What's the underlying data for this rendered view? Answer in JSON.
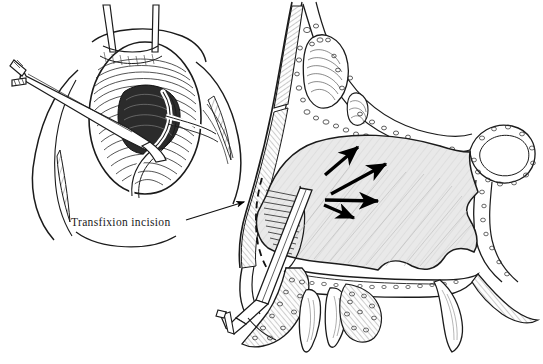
{
  "figure": {
    "background_color": "#ffffff",
    "ink_color": "#1a1a1a",
    "cartilage_fill": "#e9e9e9",
    "bone_fill": "#fcfcfc",
    "width": 543,
    "height": 364
  },
  "labels": [
    {
      "id": "transfixion",
      "text": "Transfixion incision",
      "x": 71,
      "y": 216,
      "leader_from": [
        187,
        219
      ],
      "leader_to": [
        247,
        203
      ]
    }
  ],
  "panels": {
    "inset": {
      "name": "nostril-view",
      "description": "Anterior view of nostril with retractor elevating the nasal tip and a knife making the transfixion incision along the caudal septum",
      "elements": [
        "retractor-prong-left",
        "retractor-prong-right",
        "nostril-rim",
        "septal-cartilage-hatching",
        "incision-line",
        "knife-blade",
        "knife-handle",
        "alar-margin-left",
        "alar-margin-right"
      ]
    },
    "sagittal": {
      "name": "sagittal-section",
      "description": "Sagittal cross-section of the nose showing nasal bone, frontal sinus, quadrangular septal cartilage, perpendicular plate, vomer, sphenoid sinus, hard palate and maxillary teeth with arrows indicating the plane of dissection",
      "elements": [
        "nasal-dorsum-skin",
        "nasal-bone-hatched",
        "frontal-sinus",
        "cribriform-region",
        "perpendicular-plate",
        "sphenoid-sinus",
        "septal-cartilage-body",
        "vomer",
        "hard-palate",
        "maxillary-teeth",
        "alveolar-bone",
        "columella",
        "retractor-shaft",
        "retractor-fork-tip"
      ],
      "arrows": [
        {
          "id": "arrow-1",
          "from": [
            325,
            175
          ],
          "to": [
            360,
            146
          ],
          "label": "dissection-direction-superior"
        },
        {
          "id": "arrow-2",
          "from": [
            331,
            194
          ],
          "to": [
            390,
            163
          ],
          "label": "dissection-direction-superoposterior"
        },
        {
          "id": "arrow-3",
          "from": [
            325,
            200
          ],
          "to": [
            382,
            201
          ],
          "label": "dissection-direction-posterior"
        },
        {
          "id": "arrow-4",
          "from": [
            325,
            206
          ],
          "to": [
            357,
            219
          ],
          "label": "dissection-direction-inferoposterior"
        }
      ]
    }
  }
}
